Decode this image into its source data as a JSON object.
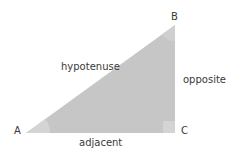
{
  "diagram": {
    "vertices": {
      "A": {
        "label": "A"
      },
      "B": {
        "label": "B"
      },
      "C": {
        "label": "C"
      }
    },
    "sides": {
      "hypotenuse": "hypotenuse",
      "opposite": "opposite",
      "adjacent": "adjacent"
    },
    "colors": {
      "fill": "#c6c6c6",
      "angle_mark": "#d6d6d6",
      "text": "#3a3a3a"
    }
  }
}
